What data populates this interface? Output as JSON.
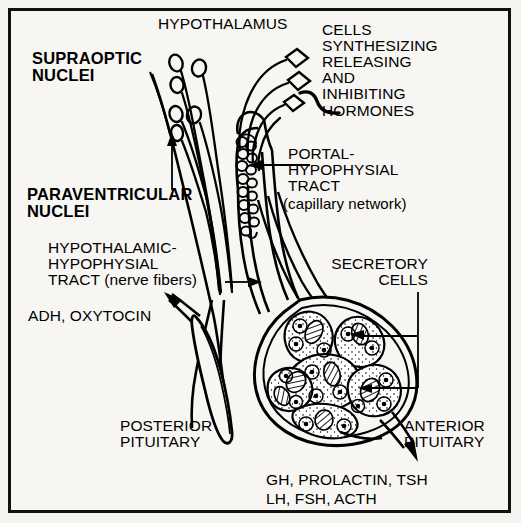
{
  "figure": {
    "background_color": "#f7f6f3",
    "ink_color": "#000000",
    "border_color": "#111111"
  },
  "labels": {
    "hypothalamus": "HYPOTHALAMUS",
    "supraoptic_nuclei": "SUPRAOPTIC\nNUCLEI",
    "paraventricular_nuclei": "PARAVENTRICULAR\nNUCLEI",
    "cells_synthesizing": "CELLS\nSYNTHESIZING\nRELEASING\nAND\nINHIBITING\nHORMONES",
    "portal_tract": "PORTAL-\nHYPOPHYSIAL\nTRACT",
    "portal_tract_sub": "(capillary network)",
    "hypothalamic_tract": "HYPOTHALAMIC-\nHYPOPHYSIAL\nTRACT (nerve fibers)",
    "adh_oxytocin": "ADH, OXYTOCIN",
    "secretory_cells": "SECRETORY\nCELLS",
    "posterior_pituitary": "POSTERIOR\nPITUITARY",
    "anterior_pituitary": "ANTERIOR\nPITUITARY",
    "anterior_hormones_line1": "GH, PROLACTIN, TSH",
    "anterior_hormones_line2": "LH, FSH, ACTH"
  }
}
